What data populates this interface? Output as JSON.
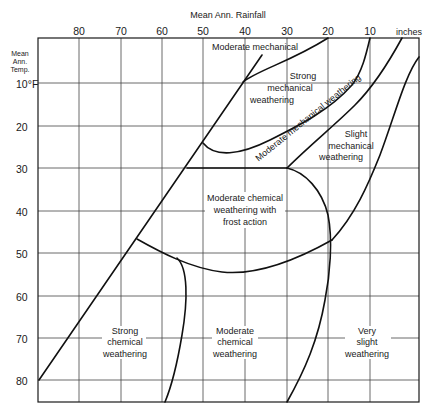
{
  "diagram": {
    "type": "phase-region-diagram",
    "x_axis": {
      "title": "Mean Ann. Rainfall",
      "unit_label": "inches",
      "ticks": [
        "80",
        "70",
        "60",
        "50",
        "40",
        "30",
        "20",
        "10"
      ],
      "direction": "decreasing-left-to-right"
    },
    "y_axis": {
      "title_lines": [
        "Mean",
        "Ann.",
        "Temp."
      ],
      "ticks": [
        "10°F",
        "20",
        "30",
        "40",
        "50",
        "60",
        "70",
        "80"
      ],
      "direction": "increasing-downward"
    },
    "regions": [
      {
        "id": "moderate-mechanical",
        "lines": [
          "Moderate mechanical"
        ]
      },
      {
        "id": "strong-mechanical",
        "lines": [
          "Strong",
          "mechanical",
          "weathering"
        ]
      },
      {
        "id": "moderate-mechanical-band",
        "lines": [
          "Moderate mechanical weathering"
        ]
      },
      {
        "id": "slight-mechanical",
        "lines": [
          "Slight",
          "mechanical",
          "weathering"
        ]
      },
      {
        "id": "moderate-chemical-frost",
        "lines": [
          "Moderate chemical",
          "weathering with",
          "frost action"
        ]
      },
      {
        "id": "strong-chemical",
        "lines": [
          "Strong",
          "chemical",
          "weathering"
        ]
      },
      {
        "id": "moderate-chemical",
        "lines": [
          "Moderate",
          "chemical",
          "weathering"
        ]
      },
      {
        "id": "very-slight",
        "lines": [
          "Very",
          "slight",
          "weathering"
        ]
      }
    ]
  }
}
